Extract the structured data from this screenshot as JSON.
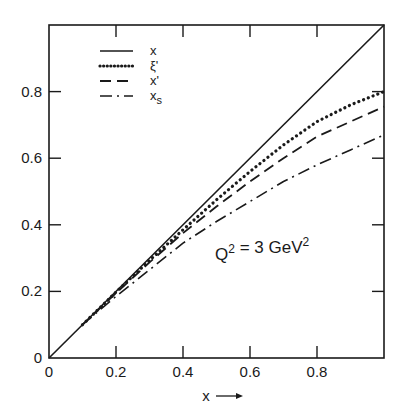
{
  "chart_data": {
    "type": "line",
    "title": "",
    "xlabel": "x →",
    "ylabel": "",
    "xlim": [
      0,
      1
    ],
    "ylim": [
      0,
      1
    ],
    "grid": false,
    "legend_position": "upper-left",
    "x_ticks": [
      "0",
      "0.2",
      "0.4",
      "0.6",
      "0.8"
    ],
    "y_ticks": [
      "0",
      "0.2",
      "0.4",
      "0.6",
      "0.8"
    ],
    "annotation": "Q² = 3 GeV²",
    "series": [
      {
        "name": "x",
        "style": "solid",
        "x": [
          0,
          1
        ],
        "y": [
          0,
          1
        ]
      },
      {
        "name": "ξ'",
        "style": "dotted",
        "x": [
          0.1,
          0.2,
          0.3,
          0.4,
          0.5,
          0.6,
          0.7,
          0.8,
          0.9,
          1.0
        ],
        "y": [
          0.1,
          0.198,
          0.293,
          0.385,
          0.475,
          0.56,
          0.64,
          0.71,
          0.76,
          0.8
        ]
      },
      {
        "name": "x'",
        "style": "dashed",
        "x": [
          0.1,
          0.2,
          0.3,
          0.4,
          0.5,
          0.6,
          0.7,
          0.8,
          0.9,
          1.0
        ],
        "y": [
          0.1,
          0.195,
          0.287,
          0.375,
          0.455,
          0.53,
          0.6,
          0.665,
          0.71,
          0.755
        ]
      },
      {
        "name": "x_s",
        "style": "dash-dot",
        "x": [
          0.1,
          0.2,
          0.3,
          0.4,
          0.5,
          0.6,
          0.7,
          0.8,
          0.9,
          1.0
        ],
        "y": [
          0.1,
          0.185,
          0.265,
          0.345,
          0.41,
          0.47,
          0.53,
          0.58,
          0.625,
          0.67
        ]
      }
    ]
  }
}
